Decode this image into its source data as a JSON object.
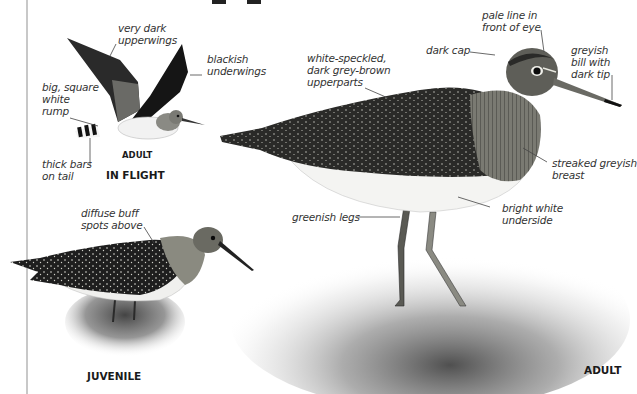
{
  "page": {
    "title_fragment": "pp"
  },
  "in_flight": {
    "caption": "IN FLIGHT",
    "sub_caption": "ADULT",
    "labels": {
      "upperwings": "very dark\nupperwings",
      "underwings": "blackish\nunderwings",
      "rump": "big, square\nwhite\nrump",
      "tail": "thick bars\non tail"
    }
  },
  "adult": {
    "caption": "ADULT",
    "labels": {
      "upperparts": "white-speckled,\ndark grey-brown\nupperparts",
      "cap": "dark cap",
      "eye_line": "pale line in\nfront of eye",
      "bill": "greyish\nbill with\ndark tip",
      "breast": "streaked greyish\nbreast",
      "underside": "bright white\nunderside",
      "legs": "greenish legs"
    }
  },
  "juvenile": {
    "caption": "JUVENILE",
    "labels": {
      "spots": "diffuse buff\nspots above"
    }
  }
}
